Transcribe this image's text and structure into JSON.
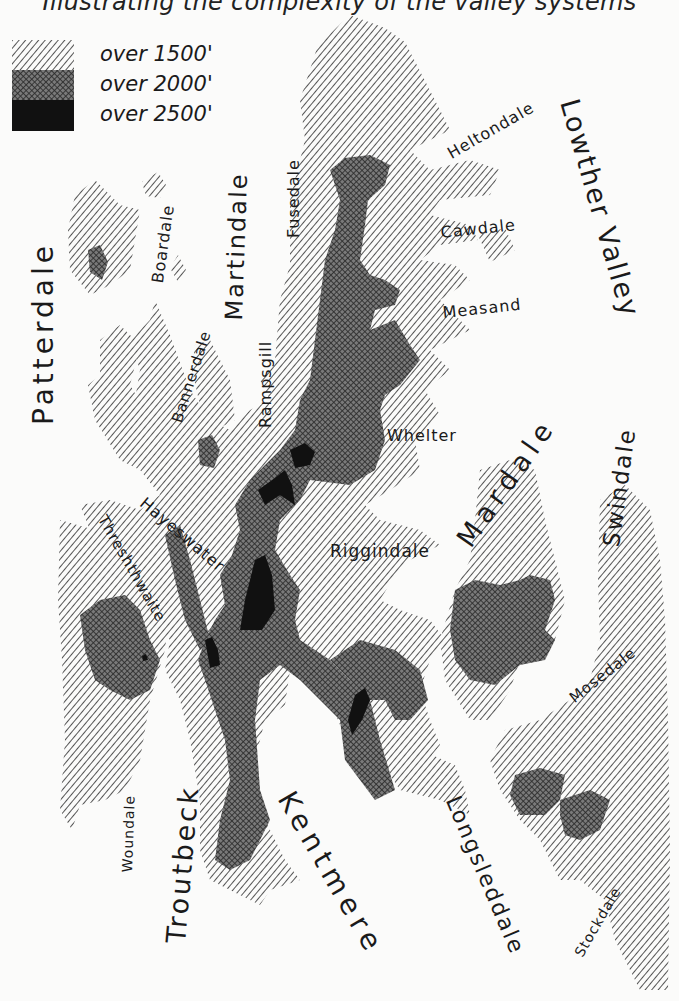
{
  "map": {
    "subtitle": "Illustrating the complexity of the valley systems",
    "legend": [
      {
        "label": "over 1500'",
        "pattern": "hatch",
        "meaning": "land over 1500 ft"
      },
      {
        "label": "over 2000'",
        "pattern": "crosshatch",
        "meaning": "land over 2000 ft"
      },
      {
        "label": "over 2500'",
        "pattern": "solid",
        "meaning": "land over 2500 ft"
      }
    ],
    "colors": {
      "paper": "#fbfbfa",
      "ink": "#1a1a1a",
      "hatch_line": "#2a2a2a",
      "crosshatch": "#3a3a3a",
      "summit": "#111111"
    },
    "valleys": {
      "patterdale": {
        "label": "Patterdale",
        "x": 30,
        "y": 425,
        "size": 28,
        "rotate": -90,
        "spacing": 4
      },
      "boardale": {
        "label": "Boardale",
        "x": 150,
        "y": 282,
        "size": 16,
        "rotate": -82,
        "spacing": 1
      },
      "martindale": {
        "label": "Martindale",
        "x": 222,
        "y": 320,
        "size": 24,
        "rotate": -88,
        "spacing": 2
      },
      "fusedale": {
        "label": "Fusedale",
        "x": 286,
        "y": 238,
        "size": 16,
        "rotate": -90,
        "spacing": 1
      },
      "heltondale": {
        "label": "Heltondale",
        "x": 445,
        "y": 148,
        "size": 16,
        "rotate": -30,
        "spacing": 1
      },
      "lowther": {
        "label": "Lowther Valley",
        "x": 582,
        "y": 96,
        "size": 27,
        "rotate": 74,
        "spacing": 2
      },
      "cawdale": {
        "label": "Cawdale",
        "x": 440,
        "y": 225,
        "size": 16,
        "rotate": -6,
        "spacing": 1
      },
      "measand": {
        "label": "Measand",
        "x": 442,
        "y": 305,
        "size": 16,
        "rotate": -6,
        "spacing": 1
      },
      "bannerdale": {
        "label": "Bannerdale",
        "x": 170,
        "y": 420,
        "size": 15,
        "rotate": -72,
        "spacing": 1
      },
      "rampsgill": {
        "label": "Rampsgill",
        "x": 258,
        "y": 428,
        "size": 16,
        "rotate": -90,
        "spacing": 1
      },
      "whelter": {
        "label": "Whelter",
        "x": 387,
        "y": 428,
        "size": 16,
        "rotate": 0,
        "spacing": 1
      },
      "mardale": {
        "label": "Mardale",
        "x": 452,
        "y": 536,
        "size": 27,
        "rotate": -55,
        "spacing": 6
      },
      "swindale": {
        "label": "Swindale",
        "x": 600,
        "y": 545,
        "size": 23,
        "rotate": -82,
        "spacing": 2
      },
      "hayeswater": {
        "label": "Hayeswater",
        "x": 147,
        "y": 495,
        "size": 16,
        "rotate": 40,
        "spacing": 1
      },
      "threshthwaite": {
        "label": "Threshthwaite",
        "x": 108,
        "y": 513,
        "size": 15,
        "rotate": 60,
        "spacing": 1
      },
      "riggindale": {
        "label": "Riggindale",
        "x": 330,
        "y": 543,
        "size": 17,
        "rotate": 0,
        "spacing": 1
      },
      "mosedale": {
        "label": "Mosedale",
        "x": 567,
        "y": 694,
        "size": 15,
        "rotate": -38,
        "spacing": 1
      },
      "woundale": {
        "label": "Woundale",
        "x": 120,
        "y": 872,
        "size": 14,
        "rotate": -88,
        "spacing": 1
      },
      "troutbeck": {
        "label": "Troutbeck",
        "x": 162,
        "y": 942,
        "size": 27,
        "rotate": -85,
        "spacing": 3
      },
      "kentmere": {
        "label": "Kentmere",
        "x": 297,
        "y": 787,
        "size": 28,
        "rotate": 60,
        "spacing": 6
      },
      "longsleddale": {
        "label": "Longsleddale",
        "x": 462,
        "y": 793,
        "size": 22,
        "rotate": 67,
        "spacing": 2
      },
      "stockdale": {
        "label": "Stockdale",
        "x": 572,
        "y": 952,
        "size": 14,
        "rotate": -60,
        "spacing": 1
      }
    }
  }
}
